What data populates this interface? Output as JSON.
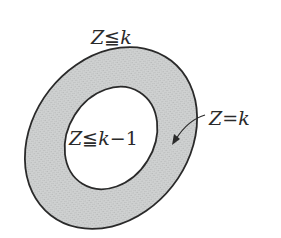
{
  "diagram": {
    "labels": {
      "outer": "Z≦k",
      "inner": "Z≦k−1",
      "ring": "Z=k"
    },
    "label_parts": {
      "outer": {
        "var": "Z",
        "rel": "≦",
        "rhs": "k"
      },
      "inner": {
        "var": "Z",
        "rel": "≦",
        "rhs": "k",
        "op": "−",
        "num": "1"
      },
      "ring": {
        "var": "Z",
        "rel": "=",
        "rhs": "k"
      }
    },
    "colors": {
      "ring_fill": "#c9cbcb",
      "inner_fill": "#ffffff",
      "stroke": "#2a2a2a",
      "background": "#ffffff"
    }
  }
}
